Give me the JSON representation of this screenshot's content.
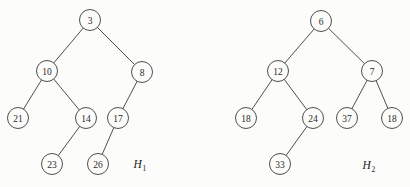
{
  "figure": {
    "kind": "binary-heap-diagram",
    "background_color": "#fcfcfa",
    "stroke_color": "#3b3b3b",
    "text_color": "#2a2a2a",
    "width": 410,
    "height": 187
  },
  "trees": [
    {
      "id": "H1",
      "name_base": "H",
      "name_sub": "1",
      "label_x": 140,
      "label_y": 164,
      "nodes": [
        {
          "id": "h1-3",
          "value": "3",
          "x": 90,
          "y": 20,
          "r": 10.5
        },
        {
          "id": "h1-10",
          "value": "10",
          "x": 47,
          "y": 71,
          "r": 10.5
        },
        {
          "id": "h1-8",
          "value": "8",
          "x": 142,
          "y": 72,
          "r": 10.5
        },
        {
          "id": "h1-21",
          "value": "21",
          "x": 18,
          "y": 118,
          "r": 10.5
        },
        {
          "id": "h1-14",
          "value": "14",
          "x": 86,
          "y": 118,
          "r": 10.5
        },
        {
          "id": "h1-17",
          "value": "17",
          "x": 118,
          "y": 118,
          "r": 10.5
        },
        {
          "id": "h1-23",
          "value": "23",
          "x": 52,
          "y": 164,
          "r": 10.5
        },
        {
          "id": "h1-26",
          "value": "26",
          "x": 98,
          "y": 164,
          "r": 10.5
        }
      ],
      "edges": [
        {
          "from": "h1-3",
          "to": "h1-10"
        },
        {
          "from": "h1-3",
          "to": "h1-8"
        },
        {
          "from": "h1-10",
          "to": "h1-21"
        },
        {
          "from": "h1-10",
          "to": "h1-14"
        },
        {
          "from": "h1-8",
          "to": "h1-17"
        },
        {
          "from": "h1-14",
          "to": "h1-23"
        },
        {
          "from": "h1-17",
          "to": "h1-26"
        }
      ]
    },
    {
      "id": "H2",
      "name_base": "H",
      "name_sub": "2",
      "label_x": 369,
      "label_y": 165,
      "nodes": [
        {
          "id": "h2-6",
          "value": "6",
          "x": 321,
          "y": 21,
          "r": 10.5
        },
        {
          "id": "h2-12",
          "value": "12",
          "x": 278,
          "y": 71,
          "r": 10.5
        },
        {
          "id": "h2-7",
          "value": "7",
          "x": 372,
          "y": 71,
          "r": 10.5
        },
        {
          "id": "h2-18a",
          "value": "18",
          "x": 246,
          "y": 118,
          "r": 10.5
        },
        {
          "id": "h2-24",
          "value": "24",
          "x": 313,
          "y": 118,
          "r": 10.5
        },
        {
          "id": "h2-37",
          "value": "37",
          "x": 347,
          "y": 118,
          "r": 10.5
        },
        {
          "id": "h2-18b",
          "value": "18",
          "x": 392,
          "y": 118,
          "r": 10.5
        },
        {
          "id": "h2-33",
          "value": "33",
          "x": 280,
          "y": 164,
          "r": 10.5
        }
      ],
      "edges": [
        {
          "from": "h2-6",
          "to": "h2-12"
        },
        {
          "from": "h2-6",
          "to": "h2-7"
        },
        {
          "from": "h2-12",
          "to": "h2-18a"
        },
        {
          "from": "h2-12",
          "to": "h2-24"
        },
        {
          "from": "h2-7",
          "to": "h2-37"
        },
        {
          "from": "h2-7",
          "to": "h2-18b"
        },
        {
          "from": "h2-24",
          "to": "h2-33"
        }
      ]
    }
  ]
}
